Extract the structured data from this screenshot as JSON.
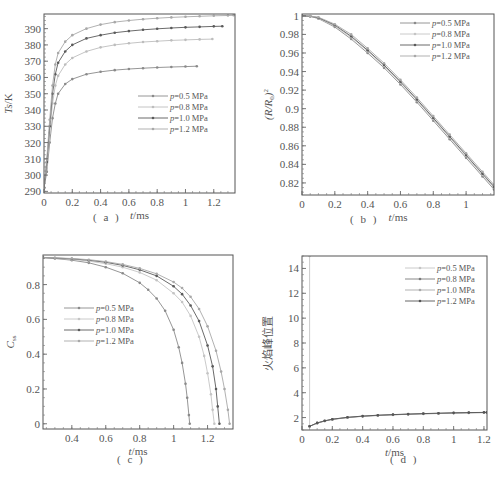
{
  "chart_data": [
    {
      "id": "a",
      "type": "line",
      "panel_label": "( a )",
      "xlabel": "t/ms",
      "ylabel": "Ts/K",
      "xlim": [
        0,
        1.35
      ],
      "ylim": [
        289,
        399
      ],
      "xticks": [
        0,
        0.2,
        0.4,
        0.6,
        0.8,
        1,
        1.2
      ],
      "xtick_labels": [
        "0",
        "0.2",
        "0.4",
        "0.6",
        "0.8",
        "1",
        "1.2"
      ],
      "yticks": [
        290,
        300,
        310,
        320,
        330,
        340,
        350,
        360,
        370,
        380,
        390
      ],
      "ytick_labels": [
        "290",
        "300",
        "310",
        "320",
        "330",
        "340",
        "350",
        "360",
        "370",
        "380",
        "390"
      ],
      "legend_position": "center-right",
      "series": [
        {
          "name": "p=0.5 MPa",
          "color": "#8a8a8a",
          "x": [
            0,
            0.02,
            0.04,
            0.06,
            0.08,
            0.1,
            0.15,
            0.2,
            0.3,
            0.4,
            0.5,
            0.6,
            0.7,
            0.8,
            0.9,
            1.0,
            1.08
          ],
          "y": [
            292,
            302,
            320,
            335,
            344,
            350,
            356,
            359,
            362,
            363.5,
            364.5,
            365.2,
            365.7,
            366.1,
            366.4,
            366.7,
            366.9
          ]
        },
        {
          "name": "p=0.8 MPa",
          "color": "#bdbdbd",
          "x": [
            0,
            0.02,
            0.04,
            0.06,
            0.08,
            0.1,
            0.15,
            0.2,
            0.3,
            0.4,
            0.5,
            0.6,
            0.7,
            0.8,
            0.9,
            1.0,
            1.1,
            1.19
          ],
          "y": [
            292,
            305,
            326,
            344,
            355,
            361,
            368,
            372,
            376,
            378.5,
            380,
            381,
            381.8,
            382.3,
            382.8,
            383.1,
            383.4,
            383.6
          ]
        },
        {
          "name": "p=1.0 MPa",
          "color": "#5a5a5a",
          "x": [
            0,
            0.02,
            0.04,
            0.06,
            0.08,
            0.1,
            0.15,
            0.2,
            0.3,
            0.4,
            0.5,
            0.6,
            0.7,
            0.8,
            0.9,
            1.0,
            1.1,
            1.2,
            1.26
          ],
          "y": [
            292,
            308,
            330,
            350,
            362,
            369,
            376,
            380,
            384,
            386,
            387.5,
            388.5,
            389.3,
            389.9,
            390.4,
            390.8,
            391.1,
            391.4,
            391.5
          ]
        },
        {
          "name": "p=1.2 MPa",
          "color": "#a8a8a8",
          "x": [
            0,
            0.02,
            0.04,
            0.06,
            0.08,
            0.1,
            0.15,
            0.2,
            0.3,
            0.4,
            0.5,
            0.6,
            0.7,
            0.8,
            0.9,
            1.0,
            1.1,
            1.2,
            1.3,
            1.34
          ],
          "y": [
            292,
            310,
            334,
            355,
            368,
            375,
            382,
            386,
            390,
            392.5,
            394,
            395,
            395.8,
            396.4,
            396.9,
            397.3,
            397.6,
            397.9,
            398.1,
            398.2
          ]
        }
      ]
    },
    {
      "id": "b",
      "type": "line",
      "panel_label": "( b )",
      "xlabel": "t/ms",
      "ylabel": "(R/R0)^2",
      "xlim": [
        0,
        1.17
      ],
      "ylim": [
        0.807,
        1.002
      ],
      "xticks": [
        0,
        0.2,
        0.4,
        0.6,
        0.8,
        1
      ],
      "xtick_labels": [
        "0",
        "0.2",
        "0.4",
        "0.6",
        "0.8",
        "1"
      ],
      "yticks": [
        0.82,
        0.84,
        0.86,
        0.88,
        0.9,
        0.92,
        0.94,
        0.96,
        0.98,
        1
      ],
      "ytick_labels": [
        "0.82",
        "0.84",
        "0.86",
        "0.88",
        "0.9",
        "0.92",
        "0.94",
        "0.96",
        "0.98",
        "1"
      ],
      "legend_position": "upper-right",
      "series": [
        {
          "name": "p=0.5 MPa",
          "color": "#8a8a8a",
          "x": [
            0,
            0.05,
            0.1,
            0.2,
            0.3,
            0.4,
            0.5,
            0.6,
            0.7,
            0.8,
            0.9,
            1.0,
            1.1,
            1.17
          ],
          "y": [
            1.0,
            0.9995,
            0.997,
            0.988,
            0.975,
            0.96,
            0.944,
            0.926,
            0.907,
            0.887,
            0.867,
            0.847,
            0.827,
            0.813
          ]
        },
        {
          "name": "p=0.8 MPa",
          "color": "#c4c4c4",
          "x": [
            0,
            0.05,
            0.1,
            0.2,
            0.3,
            0.4,
            0.5,
            0.6,
            0.7,
            0.8,
            0.9,
            1.0,
            1.1,
            1.17
          ],
          "y": [
            1.0,
            0.9995,
            0.9975,
            0.989,
            0.977,
            0.962,
            0.946,
            0.928,
            0.909,
            0.889,
            0.869,
            0.849,
            0.829,
            0.815
          ]
        },
        {
          "name": "p=1.0 MPa",
          "color": "#5a5a5a",
          "x": [
            0,
            0.05,
            0.1,
            0.2,
            0.3,
            0.4,
            0.5,
            0.6,
            0.7,
            0.8,
            0.9,
            1.0,
            1.1,
            1.17
          ],
          "y": [
            1.0,
            0.9995,
            0.998,
            0.99,
            0.978,
            0.963,
            0.947,
            0.929,
            0.91,
            0.89,
            0.87,
            0.85,
            0.83,
            0.816
          ]
        },
        {
          "name": "p=1.2 MPa",
          "color": "#a8a8a8",
          "x": [
            0,
            0.05,
            0.1,
            0.2,
            0.3,
            0.4,
            0.5,
            0.6,
            0.7,
            0.8,
            0.9,
            1.0,
            1.1,
            1.17
          ],
          "y": [
            1.0,
            0.9997,
            0.9985,
            0.991,
            0.98,
            0.965,
            0.949,
            0.931,
            0.912,
            0.892,
            0.872,
            0.852,
            0.832,
            0.818
          ]
        }
      ]
    },
    {
      "id": "c",
      "type": "line",
      "panel_label": "( c )",
      "xlabel": "t/ms",
      "ylabel": "C",
      "ylabel_sub": "ss",
      "xlim": [
        0.23,
        1.35
      ],
      "ylim": [
        -0.03,
        0.97
      ],
      "xticks": [
        0.4,
        0.6,
        0.8,
        1,
        1.2
      ],
      "xtick_labels": [
        "0.4",
        "0.6",
        "0.8",
        "1",
        "1.2"
      ],
      "yticks": [
        0,
        0.2,
        0.4,
        0.6,
        0.8
      ],
      "ytick_labels": [
        "0",
        "0.2",
        "0.4",
        "0.6",
        "0.8"
      ],
      "legend_position": "center-left",
      "series": [
        {
          "name": "p=0.5 MPa",
          "color": "#8a8a8a",
          "x": [
            0.23,
            0.3,
            0.4,
            0.5,
            0.6,
            0.7,
            0.8,
            0.85,
            0.9,
            0.95,
            1.0,
            1.03,
            1.05,
            1.07,
            1.08,
            1.09,
            1.095
          ],
          "y": [
            0.955,
            0.95,
            0.94,
            0.925,
            0.9,
            0.865,
            0.81,
            0.77,
            0.72,
            0.65,
            0.54,
            0.44,
            0.35,
            0.23,
            0.15,
            0.05,
            0.0
          ]
        },
        {
          "name": "p=0.8 MPa",
          "color": "#c4c4c4",
          "x": [
            0.23,
            0.3,
            0.4,
            0.5,
            0.6,
            0.7,
            0.8,
            0.9,
            1.0,
            1.05,
            1.1,
            1.15,
            1.18,
            1.2,
            1.22,
            1.23,
            1.24
          ],
          "y": [
            0.955,
            0.952,
            0.945,
            0.935,
            0.92,
            0.9,
            0.87,
            0.825,
            0.75,
            0.7,
            0.62,
            0.5,
            0.39,
            0.29,
            0.17,
            0.08,
            0.0
          ]
        },
        {
          "name": "p=1.0 MPa",
          "color": "#5a5a5a",
          "x": [
            0.23,
            0.3,
            0.4,
            0.5,
            0.6,
            0.7,
            0.8,
            0.9,
            1.0,
            1.05,
            1.1,
            1.15,
            1.2,
            1.23,
            1.25,
            1.26,
            1.27
          ],
          "y": [
            0.955,
            0.953,
            0.948,
            0.94,
            0.928,
            0.91,
            0.885,
            0.85,
            0.79,
            0.745,
            0.68,
            0.59,
            0.45,
            0.33,
            0.2,
            0.1,
            0.0
          ]
        },
        {
          "name": "p=1.2 MPa",
          "color": "#a8a8a8",
          "x": [
            0.23,
            0.3,
            0.4,
            0.5,
            0.6,
            0.7,
            0.8,
            0.9,
            1.0,
            1.05,
            1.1,
            1.15,
            1.2,
            1.25,
            1.28,
            1.3,
            1.32,
            1.33
          ],
          "y": [
            0.955,
            0.954,
            0.95,
            0.943,
            0.932,
            0.916,
            0.893,
            0.862,
            0.815,
            0.78,
            0.73,
            0.66,
            0.56,
            0.42,
            0.3,
            0.2,
            0.08,
            0.0
          ]
        }
      ]
    },
    {
      "id": "d",
      "type": "line",
      "panel_label": "( d )",
      "xlabel": "t/ms",
      "ylabel": "火焰峰位置",
      "xlim": [
        0,
        1.22
      ],
      "ylim": [
        1,
        15
      ],
      "xticks": [
        0,
        0.2,
        0.4,
        0.6,
        0.8,
        1,
        1.2
      ],
      "xtick_labels": [
        "0",
        "0.2",
        "0.4",
        "0.6",
        "0.8",
        "1",
        "1.2"
      ],
      "yticks": [
        2,
        4,
        6,
        8,
        10,
        12,
        14
      ],
      "ytick_labels": [
        "2",
        "4",
        "6",
        "8",
        "10",
        "12",
        "14"
      ],
      "legend_position": "upper-right",
      "series": [
        {
          "name": "p=0.5 MPa",
          "color": "#c4c4c4",
          "x": [
            0.05,
            0.05
          ],
          "y": [
            1.3,
            15
          ]
        },
        {
          "name": "p=0.8 MPa",
          "color": "#7a7a7a",
          "x": [
            0.05,
            0.1,
            0.15,
            0.2,
            0.3,
            0.4,
            0.5,
            0.6,
            0.7,
            0.8,
            0.9,
            1.0,
            1.1,
            1.2,
            1.22
          ],
          "y": [
            1.3,
            1.55,
            1.72,
            1.85,
            2.0,
            2.1,
            2.17,
            2.22,
            2.26,
            2.3,
            2.33,
            2.36,
            2.38,
            2.4,
            2.4
          ]
        },
        {
          "name": "p=1.0 MPa",
          "color": "#a8a8a8",
          "x": [
            0.05,
            0.1,
            0.15,
            0.2,
            0.3,
            0.4,
            0.5,
            0.6,
            0.7,
            0.8,
            0.9,
            1.0,
            1.1,
            1.2,
            1.22
          ],
          "y": [
            1.3,
            1.56,
            1.73,
            1.86,
            2.01,
            2.11,
            2.18,
            2.23,
            2.27,
            2.31,
            2.34,
            2.37,
            2.39,
            2.41,
            2.41
          ]
        },
        {
          "name": "p=1.2 MPa",
          "color": "#555555",
          "x": [
            0.05,
            0.1,
            0.15,
            0.2,
            0.3,
            0.4,
            0.5,
            0.6,
            0.7,
            0.8,
            0.9,
            1.0,
            1.1,
            1.2,
            1.22
          ],
          "y": [
            1.3,
            1.57,
            1.74,
            1.87,
            2.02,
            2.12,
            2.19,
            2.24,
            2.28,
            2.32,
            2.35,
            2.38,
            2.4,
            2.42,
            2.42
          ]
        }
      ]
    }
  ],
  "layout": {
    "panels": [
      {
        "left": 44,
        "top": 14,
        "width": 191,
        "height": 179,
        "legend": {
          "x": 138,
          "y": 96
        },
        "label_pos": {
          "x": 93,
          "y": 221
        }
      },
      {
        "left": 302,
        "top": 14,
        "width": 192,
        "height": 181,
        "legend": {
          "x": 400,
          "y": 23
        },
        "label_pos": {
          "x": 350,
          "y": 223
        }
      },
      {
        "left": 43,
        "top": 255,
        "width": 190,
        "height": 174,
        "legend": {
          "x": 64,
          "y": 308
        },
        "label_pos": {
          "x": 117,
          "y": 463
        }
      },
      {
        "left": 302,
        "top": 256,
        "width": 185,
        "height": 174,
        "legend": {
          "x": 405,
          "y": 268
        },
        "label_pos": {
          "x": 390,
          "y": 463
        }
      }
    ]
  }
}
